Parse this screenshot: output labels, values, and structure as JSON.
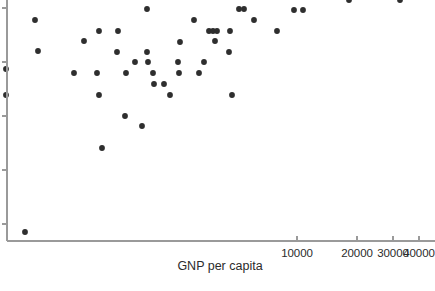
{
  "chart_data": {
    "type": "scatter",
    "title": "",
    "xlabel": "GNP per capita",
    "ylabel": "",
    "xscale": "log",
    "grid": false,
    "legend": null,
    "xticks": [
      {
        "value": 10000,
        "label": "10000",
        "px": 297
      },
      {
        "value": 20000,
        "label": "20000",
        "px": 357
      },
      {
        "value": 30000,
        "label": "30000",
        "px": 393
      },
      {
        "value": 40000,
        "label": "40000",
        "px": 419
      }
    ],
    "yticks": [
      {
        "label": "",
        "px": 8
      },
      {
        "label": "",
        "px": 62
      },
      {
        "label": "",
        "px": 116
      },
      {
        "label": "",
        "px": 170
      },
      {
        "label": "",
        "px": 224
      }
    ],
    "axis": {
      "x_axis_y_px": 241,
      "y_axis_x_px": 7,
      "plot_left_px": 7,
      "plot_right_px": 435,
      "plot_top_px": 0,
      "plot_bottom_px": 241
    },
    "marker": {
      "shape": "circle",
      "radius_px": 2.9,
      "color": "#2e2e2e"
    },
    "points": [
      {
        "x_px": 6,
        "y_px": 69
      },
      {
        "x_px": 6,
        "y_px": 95
      },
      {
        "x_px": 35,
        "y_px": 20
      },
      {
        "x_px": 38,
        "y_px": 51
      },
      {
        "x_px": 25,
        "y_px": 232
      },
      {
        "x_px": 74,
        "y_px": 73
      },
      {
        "x_px": 84,
        "y_px": 41
      },
      {
        "x_px": 99,
        "y_px": 31
      },
      {
        "x_px": 97,
        "y_px": 73
      },
      {
        "x_px": 99,
        "y_px": 95
      },
      {
        "x_px": 102,
        "y_px": 148
      },
      {
        "x_px": 118,
        "y_px": 31
      },
      {
        "x_px": 117,
        "y_px": 52
      },
      {
        "x_px": 126,
        "y_px": 73
      },
      {
        "x_px": 125,
        "y_px": 116
      },
      {
        "x_px": 135,
        "y_px": 62
      },
      {
        "x_px": 142,
        "y_px": 126
      },
      {
        "x_px": 147,
        "y_px": 9
      },
      {
        "x_px": 147,
        "y_px": 52
      },
      {
        "x_px": 148,
        "y_px": 62
      },
      {
        "x_px": 153,
        "y_px": 73
      },
      {
        "x_px": 154,
        "y_px": 84
      },
      {
        "x_px": 164,
        "y_px": 84
      },
      {
        "x_px": 170,
        "y_px": 95
      },
      {
        "x_px": 178,
        "y_px": 62
      },
      {
        "x_px": 179,
        "y_px": 73
      },
      {
        "x_px": 180,
        "y_px": 42
      },
      {
        "x_px": 194,
        "y_px": 20
      },
      {
        "x_px": 199,
        "y_px": 73
      },
      {
        "x_px": 204,
        "y_px": 62
      },
      {
        "x_px": 209,
        "y_px": 31
      },
      {
        "x_px": 213,
        "y_px": 31
      },
      {
        "x_px": 217,
        "y_px": 31
      },
      {
        "x_px": 215,
        "y_px": 41
      },
      {
        "x_px": 229,
        "y_px": 52
      },
      {
        "x_px": 230,
        "y_px": 31
      },
      {
        "x_px": 232,
        "y_px": 95
      },
      {
        "x_px": 239,
        "y_px": 9
      },
      {
        "x_px": 244,
        "y_px": 9
      },
      {
        "x_px": 254,
        "y_px": 20
      },
      {
        "x_px": 277,
        "y_px": 31
      },
      {
        "x_px": 294,
        "y_px": 10
      },
      {
        "x_px": 303,
        "y_px": 10
      },
      {
        "x_px": 349,
        "y_px": 0
      },
      {
        "x_px": 400,
        "y_px": 0
      }
    ]
  }
}
